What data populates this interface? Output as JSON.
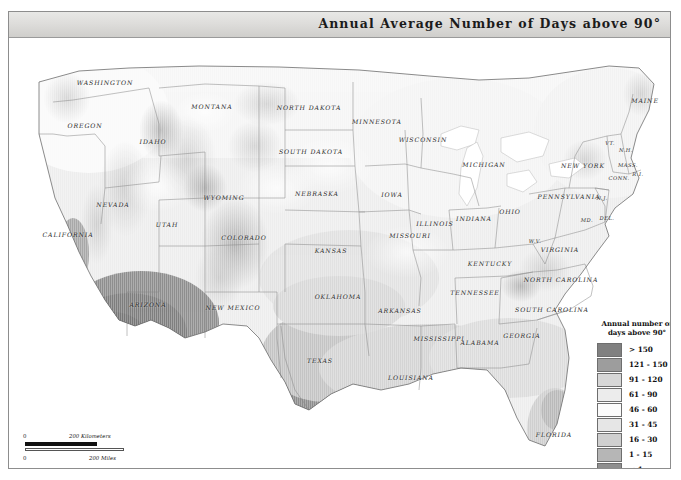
{
  "title": "Annual Average Number of Days above 90°",
  "legend": {
    "title_line1": "Annual number of",
    "title_line2": "days above 90°",
    "entries": [
      {
        "label": "> 150",
        "color": "#808080"
      },
      {
        "label": "121 - 150",
        "color": "#9d9d9d"
      },
      {
        "label": "91 - 120",
        "color": "#d7d7d7"
      },
      {
        "label": "61 - 90",
        "color": "#ececec"
      },
      {
        "label": "46 - 60",
        "color": "#fbfbfb"
      },
      {
        "label": "31 - 45",
        "color": "#e6e6e6"
      },
      {
        "label": "16 - 30",
        "color": "#cfcfcf"
      },
      {
        "label": "1 - 15",
        "color": "#b6b6b6"
      },
      {
        "label": "< 1",
        "color": "#8f8f8f"
      }
    ]
  },
  "scalebar": {
    "km_zero": "0",
    "km_label": "200 Kilometers",
    "mi_zero": "0",
    "mi_label": "200 Miles"
  },
  "source": "source: NOAA",
  "states": [
    {
      "name": "WASHINGTON",
      "x": 96,
      "y": 44,
      "size": "normal"
    },
    {
      "name": "OREGON",
      "x": 76,
      "y": 87,
      "size": "normal"
    },
    {
      "name": "IDAHO",
      "x": 144,
      "y": 103,
      "size": "normal"
    },
    {
      "name": "MONTANA",
      "x": 203,
      "y": 68,
      "size": "normal"
    },
    {
      "name": "WYOMING",
      "x": 215,
      "y": 159,
      "size": "normal"
    },
    {
      "name": "NEVADA",
      "x": 104,
      "y": 166,
      "size": "normal"
    },
    {
      "name": "CALIFORNIA",
      "x": 59,
      "y": 196,
      "size": "normal"
    },
    {
      "name": "UTAH",
      "x": 158,
      "y": 186,
      "size": "normal"
    },
    {
      "name": "ARIZONA",
      "x": 139,
      "y": 266,
      "size": "normal"
    },
    {
      "name": "NEW MEXICO",
      "x": 224,
      "y": 269,
      "size": "normal"
    },
    {
      "name": "COLORADO",
      "x": 235,
      "y": 199,
      "size": "normal"
    },
    {
      "name": "NORTH DAKOTA",
      "x": 300,
      "y": 69,
      "size": "normal"
    },
    {
      "name": "SOUTH DAKOTA",
      "x": 302,
      "y": 113,
      "size": "normal"
    },
    {
      "name": "NEBRASKA",
      "x": 308,
      "y": 155,
      "size": "normal"
    },
    {
      "name": "KANSAS",
      "x": 322,
      "y": 212,
      "size": "normal"
    },
    {
      "name": "OKLAHOMA",
      "x": 329,
      "y": 258,
      "size": "normal"
    },
    {
      "name": "TEXAS",
      "x": 311,
      "y": 322,
      "size": "normal"
    },
    {
      "name": "MINNESOTA",
      "x": 368,
      "y": 83,
      "size": "normal"
    },
    {
      "name": "IOWA",
      "x": 383,
      "y": 156,
      "size": "normal"
    },
    {
      "name": "MISSOURI",
      "x": 401,
      "y": 197,
      "size": "normal"
    },
    {
      "name": "ARKANSAS",
      "x": 391,
      "y": 272,
      "size": "normal"
    },
    {
      "name": "LOUISIANA",
      "x": 402,
      "y": 339,
      "size": "normal"
    },
    {
      "name": "WISCONSIN",
      "x": 414,
      "y": 101,
      "size": "normal"
    },
    {
      "name": "ILLINOIS",
      "x": 426,
      "y": 185,
      "size": "normal"
    },
    {
      "name": "MISSISSIPPI",
      "x": 430,
      "y": 300,
      "size": "normal"
    },
    {
      "name": "MICHIGAN",
      "x": 475,
      "y": 126,
      "size": "normal"
    },
    {
      "name": "INDIANA",
      "x": 465,
      "y": 180,
      "size": "normal"
    },
    {
      "name": "KENTUCKY",
      "x": 481,
      "y": 225,
      "size": "normal"
    },
    {
      "name": "TENNESSEE",
      "x": 466,
      "y": 254,
      "size": "normal"
    },
    {
      "name": "ALABAMA",
      "x": 471,
      "y": 304,
      "size": "normal"
    },
    {
      "name": "GEORGIA",
      "x": 513,
      "y": 297,
      "size": "normal"
    },
    {
      "name": "FLORIDA",
      "x": 545,
      "y": 396,
      "size": "normal"
    },
    {
      "name": "OHIO",
      "x": 501,
      "y": 173,
      "size": "normal"
    },
    {
      "name": "W.V.",
      "x": 526,
      "y": 203,
      "size": "sm"
    },
    {
      "name": "VIRGINIA",
      "x": 551,
      "y": 211,
      "size": "normal"
    },
    {
      "name": "MD.",
      "x": 578,
      "y": 182,
      "size": "sm"
    },
    {
      "name": "DEL.",
      "x": 598,
      "y": 180,
      "size": "sm"
    },
    {
      "name": "NORTH CAROLINA",
      "x": 552,
      "y": 241,
      "size": "normal"
    },
    {
      "name": "SOUTH CAROLINA",
      "x": 543,
      "y": 271,
      "size": "normal"
    },
    {
      "name": "PENNSYLVANIA",
      "x": 560,
      "y": 158,
      "size": "normal"
    },
    {
      "name": "N.J.",
      "x": 593,
      "y": 160,
      "size": "sm"
    },
    {
      "name": "NEW YORK",
      "x": 574,
      "y": 127,
      "size": "normal"
    },
    {
      "name": "VT.",
      "x": 601,
      "y": 105,
      "size": "sm"
    },
    {
      "name": "N.H.",
      "x": 617,
      "y": 112,
      "size": "sm"
    },
    {
      "name": "MASS.",
      "x": 619,
      "y": 127,
      "size": "sm"
    },
    {
      "name": "CONN.",
      "x": 610,
      "y": 140,
      "size": "sm"
    },
    {
      "name": "R.I.",
      "x": 629,
      "y": 136,
      "size": "sm"
    },
    {
      "name": "MAINE",
      "x": 636,
      "y": 62,
      "size": "normal"
    }
  ]
}
